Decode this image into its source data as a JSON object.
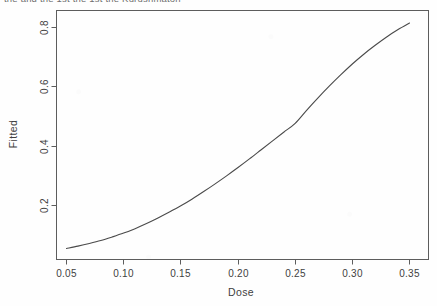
{
  "figure": {
    "clipped_top_text": "the and the 1st the 1st the Kurushmaton",
    "background_color": "#fefefe",
    "line_color": "#4a4a4a",
    "axis_color": "#5d5d5d"
  },
  "chart_data": {
    "type": "line",
    "title": "",
    "xlabel": "Dose",
    "ylabel": "Fitted",
    "xlim": [
      0.035,
      0.36
    ],
    "ylim": [
      0.035,
      0.86
    ],
    "xticks": [
      0.05,
      0.1,
      0.15,
      0.2,
      0.25,
      0.3,
      0.35
    ],
    "xticklabels": [
      "0.05",
      "0.10",
      "0.15",
      "0.20",
      "0.25",
      "0.30",
      "0.35"
    ],
    "yticks": [
      0.2,
      0.4,
      0.6,
      0.8
    ],
    "yticklabels": [
      "0.2",
      "0.4",
      "0.6",
      "0.8"
    ],
    "grid": false,
    "legend": false,
    "series": [
      {
        "name": "fitted",
        "x": [
          0.05,
          0.06,
          0.07,
          0.08,
          0.09,
          0.1,
          0.11,
          0.12,
          0.13,
          0.14,
          0.15,
          0.16,
          0.17,
          0.18,
          0.19,
          0.2,
          0.21,
          0.22,
          0.23,
          0.24,
          0.25,
          0.26,
          0.27,
          0.28,
          0.29,
          0.3,
          0.31,
          0.32,
          0.33,
          0.34,
          0.35
        ],
        "y": [
          0.055,
          0.063,
          0.072,
          0.082,
          0.094,
          0.107,
          0.122,
          0.139,
          0.158,
          0.178,
          0.199,
          0.222,
          0.247,
          0.273,
          0.3,
          0.328,
          0.357,
          0.387,
          0.417,
          0.447,
          0.477,
          0.521,
          0.563,
          0.603,
          0.641,
          0.677,
          0.71,
          0.74,
          0.768,
          0.793,
          0.815
        ]
      }
    ]
  }
}
